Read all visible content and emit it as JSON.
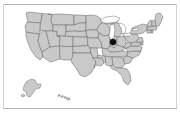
{
  "figure": {
    "kind": "choropleth-basemap",
    "title": "",
    "caption": "",
    "background_color": "#ffffff",
    "frame_rule_color": "#b0b0b0"
  },
  "map": {
    "name": "united-states-map",
    "region": "United States of America",
    "projection_look": "albers-usa",
    "land_fill_color": "#c9c9c9",
    "border_color": "#6e6e6e",
    "water_fill_color": "#ffffff",
    "shows_state_boundaries": true,
    "insets": [
      {
        "name": "alaska-inset",
        "label": "Alaska"
      },
      {
        "name": "hawaii-inset",
        "label": "Hawaii"
      }
    ],
    "water_bodies": [
      {
        "name": "lake-superior",
        "label": "Lake Superior"
      },
      {
        "name": "lake-michigan",
        "label": "Lake Michigan"
      },
      {
        "name": "lake-huron",
        "label": "Lake Huron"
      },
      {
        "name": "lake-erie",
        "label": "Lake Erie"
      },
      {
        "name": "lake-ontario",
        "label": "Lake Ontario"
      }
    ]
  },
  "markers": [
    {
      "name": "location-marker",
      "label": "",
      "color": "#101010",
      "shape": "circle",
      "x_px": 113,
      "y_px": 42,
      "approx_region": "Northern Illinois / Lake Michigan shore"
    }
  ],
  "legend": {
    "visible": false,
    "entries": []
  },
  "chart_data": {
    "type": "map",
    "title": "",
    "xlabel": "",
    "ylabel": "",
    "point_count": 1,
    "points": [
      {
        "label": "",
        "x": 113,
        "y": 42,
        "value": 1,
        "color": "#101010"
      }
    ]
  }
}
